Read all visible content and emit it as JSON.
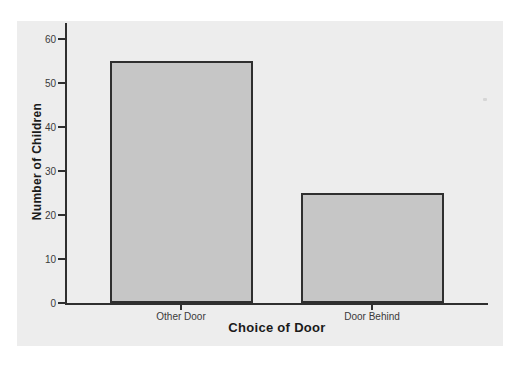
{
  "chart_data": {
    "type": "bar",
    "title": "",
    "categories": [
      "Other Door",
      "Door Behind"
    ],
    "values": [
      55,
      25
    ],
    "xlabel": "Choice of Door",
    "ylabel": "Number of Children",
    "ylim": [
      0,
      63
    ],
    "yticks": [
      0,
      10,
      20,
      30,
      40,
      50,
      60
    ],
    "grid": false,
    "legend": false,
    "colors": {
      "panel_bg": "#ededed",
      "bar_fill": "#c6c6c6",
      "bar_border": "#2f2f2f",
      "axis": "#2f2f2f",
      "tick_label": "#3a3a3a",
      "title_text": "#1a1a1a"
    }
  }
}
